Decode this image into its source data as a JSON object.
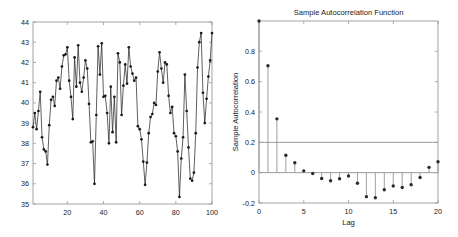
{
  "figure": {
    "background_color": "#ffffff",
    "axis_color": "#9a9a9a",
    "data_color": "#1a1a1a",
    "marker_color": "#1a1a1a"
  },
  "chart_data": [
    {
      "type": "line",
      "panel": "left",
      "title": "",
      "xlabel": "",
      "ylabel": "",
      "xlim": [
        1,
        100
      ],
      "ylim": [
        35,
        44
      ],
      "xticks": [
        20,
        40,
        60,
        80,
        100
      ],
      "xtick_labels": [
        "20",
        "40",
        "60",
        "80",
        "100"
      ],
      "yticks": [
        35,
        36,
        37,
        38,
        39,
        40,
        41,
        42,
        43,
        44
      ],
      "ytick_labels": [
        "35",
        "36",
        "37",
        "38",
        "39",
        "40",
        "41",
        "42",
        "43",
        "44"
      ],
      "grid": false,
      "legend": "none",
      "marker": "filled-circle",
      "x": [
        1,
        2,
        3,
        4,
        5,
        6,
        7,
        8,
        9,
        10,
        11,
        12,
        13,
        14,
        15,
        16,
        17,
        18,
        19,
        20,
        21,
        22,
        23,
        24,
        25,
        26,
        27,
        28,
        29,
        30,
        31,
        32,
        33,
        34,
        35,
        36,
        37,
        38,
        39,
        40,
        41,
        42,
        43,
        44,
        45,
        46,
        47,
        48,
        49,
        50,
        51,
        52,
        53,
        54,
        55,
        56,
        57,
        58,
        59,
        60,
        61,
        62,
        63,
        64,
        65,
        66,
        67,
        68,
        69,
        70,
        71,
        72,
        73,
        74,
        75,
        76,
        77,
        78,
        79,
        80,
        81,
        82,
        83,
        84,
        85,
        86,
        87,
        88,
        89,
        90,
        91,
        92,
        93,
        94,
        95,
        96,
        97,
        98,
        99,
        100
      ],
      "values": [
        38.8,
        39.5,
        38.7,
        39.6,
        40.55,
        38.3,
        37.7,
        37.6,
        36.95,
        38.9,
        40.15,
        40.3,
        39.85,
        41.1,
        41.25,
        40.7,
        41.8,
        42.35,
        42.4,
        42.75,
        41.1,
        40.3,
        39.2,
        42.25,
        40.8,
        42.85,
        41.0,
        40.55,
        41.25,
        42.1,
        41.7,
        39.95,
        38.05,
        38.1,
        36.0,
        39.4,
        42.8,
        41.4,
        42.95,
        40.3,
        40.35,
        39.5,
        38.0,
        40.8,
        38.55,
        40.3,
        38.05,
        42.45,
        42.0,
        39.4,
        40.85,
        41.9,
        40.95,
        42.75,
        41.8,
        41.45,
        41.1,
        41.25,
        38.85,
        38.7,
        38.2,
        37.1,
        35.95,
        37.05,
        38.5,
        39.3,
        39.45,
        40.0,
        39.9,
        41.55,
        42.5,
        41.7,
        41.0,
        42.0,
        41.9,
        40.35,
        39.5,
        39.8,
        38.5,
        38.35,
        37.6,
        35.35,
        37.25,
        38.3,
        41.4,
        39.6,
        37.8,
        36.25,
        36.15,
        36.55,
        38.5,
        41.75,
        43.0,
        43.45,
        40.5,
        39.0,
        40.2,
        41.3,
        42.1,
        43.45
      ]
    },
    {
      "type": "bar",
      "panel": "right",
      "title": "Sample Autocorrelation Function",
      "xlabel": "Lag",
      "ylabel": "Sample Autocorrelation",
      "xlim": [
        0,
        20
      ],
      "ylim": [
        -0.2,
        1.0
      ],
      "xticks": [
        0,
        5,
        10,
        15,
        20
      ],
      "xtick_labels": [
        "0",
        "5",
        "10",
        "15",
        "20"
      ],
      "yticks": [
        -0.2,
        0,
        0.2,
        0.4,
        0.6,
        0.8
      ],
      "ytick_labels": [
        "-0.2",
        "0",
        "0.2",
        "0.4",
        "0.6",
        "0.8"
      ],
      "grid": false,
      "legend": "none",
      "marker": "filled-circle",
      "confidence_bound": 0.2,
      "categories": [
        0,
        1,
        2,
        3,
        4,
        5,
        6,
        7,
        8,
        9,
        10,
        11,
        12,
        13,
        14,
        15,
        16,
        17,
        18,
        19,
        20
      ],
      "values": [
        1.0,
        0.705,
        0.355,
        0.115,
        0.065,
        0.012,
        -0.005,
        -0.038,
        -0.053,
        -0.04,
        -0.022,
        -0.07,
        -0.158,
        -0.165,
        -0.113,
        -0.088,
        -0.098,
        -0.08,
        -0.032,
        0.035,
        0.072
      ]
    }
  ]
}
